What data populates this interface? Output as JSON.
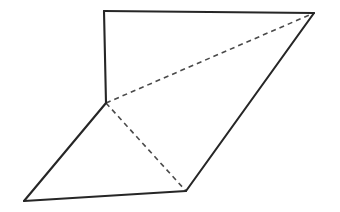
{
  "figure": {
    "background_color": "#ffffff",
    "solid_edge_color": "#262626",
    "hidden_edge_color": "#4a4a4a",
    "solid_edge_width": 2.1,
    "hidden_edge_width": 1.6,
    "hidden_dash_pattern": "5 4",
    "canvas": {
      "width": 340,
      "height": 212
    },
    "vertices": [
      {
        "id": "A",
        "x": 104,
        "y": 11,
        "note": "top-left apex"
      },
      {
        "id": "B",
        "x": 314,
        "y": 13,
        "note": "top-right apex"
      },
      {
        "id": "C",
        "x": 106,
        "y": 103,
        "note": "middle junction where three hidden/visible edges meet"
      },
      {
        "id": "D",
        "x": 24,
        "y": 201,
        "note": "bottom-left apex"
      },
      {
        "id": "E",
        "x": 186,
        "y": 191,
        "note": "bottom-middle apex"
      }
    ],
    "edges": [
      {
        "id": "AB",
        "from": "A",
        "to": "B",
        "style": "solid",
        "path": "M 104 11 L 314 13"
      },
      {
        "id": "AC",
        "from": "A",
        "to": "C",
        "style": "solid",
        "path": "M 104 11 L 106 103"
      },
      {
        "id": "CD",
        "from": "C",
        "to": "D",
        "style": "solid",
        "path": "M 106 103 L 24 201"
      },
      {
        "id": "DE",
        "from": "D",
        "to": "E",
        "style": "solid",
        "path": "M 24 201 L 186 191"
      },
      {
        "id": "EB",
        "from": "E",
        "to": "B",
        "style": "solid",
        "path": "M 186 191 L 314 13"
      },
      {
        "id": "CB",
        "from": "C",
        "to": "B",
        "style": "hidden",
        "path": "M 106 103 L 314 13"
      },
      {
        "id": "CE",
        "from": "C",
        "to": "E",
        "style": "hidden",
        "path": "M 106 103 L 186 191"
      }
    ],
    "outline_path": "M 104 11 L 314 13 L 186 191 L 24 201 L 106 103 Z"
  }
}
